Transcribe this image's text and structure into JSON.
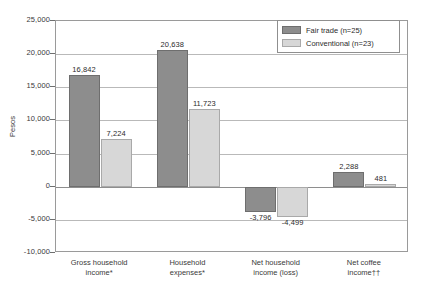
{
  "chart_data": {
    "type": "bar",
    "title": "",
    "xlabel": "",
    "ylabel": "Pesos",
    "ylim": [
      -10000,
      25000
    ],
    "ytick_step": 5000,
    "grid": true,
    "legend_position": "top-right",
    "categories": [
      "Gross household\nincome*",
      "Household\nexpenses*",
      "Net household\nincome (loss)",
      "Net coffee\nincome††"
    ],
    "ticks": [
      "25,000",
      "20,000",
      "15,000",
      "10,000",
      "5,000",
      "0",
      "-5,000",
      "-10,000"
    ],
    "tick_values": [
      25000,
      20000,
      15000,
      10000,
      5000,
      0,
      -5000,
      -10000
    ],
    "series": [
      {
        "name": "Fair trade (n=25)",
        "color": "#8d8d8d",
        "values": [
          16842,
          20638,
          -3796,
          2288
        ],
        "labels": [
          "16,842",
          "20,638",
          "-3,796",
          "2,288"
        ]
      },
      {
        "name": "Conventional (n=23)",
        "color": "#d7d7d7",
        "values": [
          7224,
          11723,
          -4499,
          481
        ],
        "labels": [
          "7,224",
          "11,723",
          "-4,499",
          "481"
        ]
      }
    ]
  },
  "legend": {
    "items": [
      {
        "label": "Fair trade (n=25)",
        "swatch": "dark"
      },
      {
        "label": "Conventional (n=23)",
        "swatch": "light"
      }
    ]
  }
}
